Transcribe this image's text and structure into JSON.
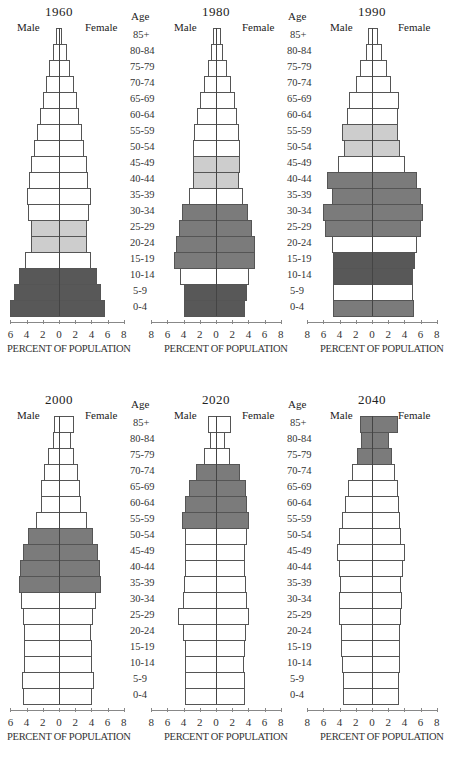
{
  "figure": {
    "side_labels": {
      "male": "Male",
      "female": "Female"
    },
    "age_header": "Age",
    "xlabel": "PERCENT OF POPULATION",
    "ticks": [
      "8",
      "6",
      "4",
      "2",
      "0",
      "2",
      "4",
      "6",
      "8"
    ],
    "colors": {
      "none": "#ffffff",
      "light": "#cdcdcd",
      "mid": "#7b7b7b",
      "dark": "#585858"
    }
  },
  "chart_data": [
    {
      "type": "bar",
      "title": "1960",
      "xlabel": "PERCENT OF POPULATION",
      "categories": [
        "85+",
        "80-84",
        "75-79",
        "70-74",
        "65-69",
        "60-64",
        "55-59",
        "50-54",
        "45-49",
        "40-44",
        "35-39",
        "30-34",
        "25-29",
        "20-24",
        "15-19",
        "10-14",
        "5-9",
        "0-4"
      ],
      "series": [
        {
          "name": "Male",
          "values": [
            0.4,
            0.8,
            1.2,
            1.6,
            2.0,
            2.3,
            2.7,
            3.1,
            3.5,
            3.7,
            4.0,
            3.8,
            3.5,
            3.5,
            4.2,
            5.0,
            5.5,
            6.0
          ]
        },
        {
          "name": "Female",
          "values": [
            0.4,
            1.0,
            1.4,
            1.8,
            2.2,
            2.5,
            2.8,
            3.1,
            3.4,
            3.6,
            3.9,
            3.7,
            3.4,
            3.4,
            4.0,
            4.7,
            5.2,
            5.7
          ]
        }
      ],
      "shading": [
        "none",
        "none",
        "none",
        "none",
        "none",
        "none",
        "none",
        "none",
        "none",
        "none",
        "none",
        "none",
        "light",
        "light",
        "none",
        "dark",
        "dark",
        "dark"
      ],
      "xlim": [
        -8,
        8
      ]
    },
    {
      "type": "bar",
      "title": "1980",
      "xlabel": "PERCENT OF POPULATION",
      "categories": [
        "85+",
        "80-84",
        "75-79",
        "70-74",
        "65-69",
        "60-64",
        "55-59",
        "50-54",
        "45-49",
        "40-44",
        "35-39",
        "30-34",
        "25-29",
        "20-24",
        "15-19",
        "10-14",
        "5-9",
        "0-4"
      ],
      "series": [
        {
          "name": "Male",
          "values": [
            0.4,
            0.6,
            1.0,
            1.5,
            2.0,
            2.3,
            2.7,
            2.9,
            2.9,
            2.8,
            3.3,
            4.2,
            4.6,
            5.0,
            5.2,
            4.5,
            4.0,
            4.0
          ]
        },
        {
          "name": "Female",
          "values": [
            0.6,
            0.9,
            1.4,
            1.9,
            2.3,
            2.6,
            2.9,
            3.0,
            3.0,
            2.9,
            3.3,
            4.0,
            4.4,
            4.8,
            4.8,
            4.1,
            3.8,
            3.6
          ]
        }
      ],
      "shading": [
        "none",
        "none",
        "none",
        "none",
        "none",
        "none",
        "none",
        "none",
        "light",
        "light",
        "none",
        "mid",
        "mid",
        "mid",
        "mid",
        "none",
        "dark",
        "dark"
      ],
      "xlim": [
        -8,
        8
      ]
    },
    {
      "type": "bar",
      "title": "1990",
      "xlabel": "PERCENT OF POPULATION",
      "categories": [
        "85+",
        "80-84",
        "75-79",
        "70-74",
        "65-69",
        "60-64",
        "55-59",
        "50-54",
        "45-49",
        "40-44",
        "35-39",
        "30-34",
        "25-29",
        "20-24",
        "15-19",
        "10-14",
        "5-9",
        "0-4"
      ],
      "series": [
        {
          "name": "Male",
          "values": [
            0.5,
            0.8,
            1.5,
            2.0,
            2.8,
            3.1,
            3.7,
            3.4,
            4.2,
            5.5,
            4.9,
            6.0,
            5.8,
            4.9,
            4.8,
            4.8,
            4.8,
            4.8
          ]
        },
        {
          "name": "Female",
          "values": [
            0.8,
            1.2,
            1.9,
            2.4,
            3.3,
            3.2,
            3.2,
            3.5,
            4.1,
            5.5,
            6.0,
            6.3,
            6.0,
            5.6,
            5.3,
            5.1,
            5.1,
            5.2
          ]
        }
      ],
      "shading": [
        "none",
        "none",
        "none",
        "none",
        "none",
        "none",
        "light",
        "light",
        "none",
        "mid",
        "mid",
        "mid",
        "mid",
        "none",
        "dark",
        "dark",
        "none",
        "mid"
      ],
      "xlim": [
        -8,
        8
      ]
    },
    {
      "type": "bar",
      "title": "2000",
      "xlabel": "PERCENT OF POPULATION",
      "categories": [
        "85+",
        "80-84",
        "75-79",
        "70-74",
        "65-69",
        "60-64",
        "55-59",
        "50-54",
        "45-49",
        "40-44",
        "35-39",
        "30-34",
        "25-29",
        "20-24",
        "15-19",
        "10-14",
        "5-9",
        "0-4"
      ],
      "series": [
        {
          "name": "Male",
          "values": [
            0.6,
            0.8,
            1.3,
            1.8,
            2.2,
            2.2,
            2.8,
            3.8,
            4.4,
            4.8,
            5.0,
            4.7,
            4.4,
            4.3,
            4.3,
            4.3,
            4.6,
            4.4
          ]
        },
        {
          "name": "Female",
          "values": [
            1.8,
            1.5,
            1.9,
            2.3,
            2.6,
            2.7,
            3.4,
            4.2,
            4.8,
            5.1,
            5.2,
            4.6,
            4.2,
            4.0,
            4.1,
            4.1,
            4.3,
            4.1
          ]
        }
      ],
      "shading": [
        "none",
        "none",
        "none",
        "none",
        "none",
        "none",
        "none",
        "mid",
        "mid",
        "mid",
        "mid",
        "none",
        "none",
        "none",
        "none",
        "none",
        "none",
        "none"
      ],
      "xlim": [
        -8,
        8
      ]
    },
    {
      "type": "bar",
      "title": "2020",
      "xlabel": "PERCENT OF POPULATION",
      "categories": [
        "85+",
        "80-84",
        "75-79",
        "70-74",
        "65-69",
        "60-64",
        "55-59",
        "50-54",
        "45-49",
        "40-44",
        "35-39",
        "30-34",
        "25-29",
        "20-24",
        "15-19",
        "10-14",
        "5-9",
        "0-4"
      ],
      "series": [
        {
          "name": "Male",
          "values": [
            1.0,
            0.7,
            1.5,
            2.5,
            3.3,
            3.8,
            4.2,
            3.8,
            3.8,
            3.8,
            4.0,
            4.1,
            4.7,
            4.1,
            3.8,
            3.8,
            3.8,
            3.8
          ]
        },
        {
          "name": "Female",
          "values": [
            1.8,
            1.1,
            1.7,
            3.0,
            3.7,
            3.8,
            4.1,
            3.8,
            3.6,
            3.6,
            3.7,
            3.8,
            4.1,
            3.7,
            3.6,
            3.5,
            3.6,
            3.6
          ]
        }
      ],
      "shading": [
        "none",
        "none",
        "none",
        "mid",
        "mid",
        "mid",
        "mid",
        "none",
        "none",
        "none",
        "none",
        "none",
        "none",
        "none",
        "none",
        "none",
        "none",
        "none"
      ],
      "xlim": [
        -8,
        8
      ]
    },
    {
      "type": "bar",
      "title": "2040",
      "xlabel": "PERCENT OF POPULATION",
      "categories": [
        "85+",
        "80-84",
        "75-79",
        "70-74",
        "65-69",
        "60-64",
        "55-59",
        "50-54",
        "45-49",
        "40-44",
        "35-39",
        "30-34",
        "25-29",
        "20-24",
        "15-19",
        "10-14",
        "5-9",
        "0-4"
      ],
      "series": [
        {
          "name": "Male",
          "values": [
            1.5,
            1.3,
            1.8,
            2.5,
            3.0,
            3.3,
            3.7,
            4.1,
            4.3,
            4.1,
            4.0,
            4.1,
            4.1,
            3.8,
            3.8,
            3.7,
            3.6,
            3.6
          ]
        },
        {
          "name": "Female",
          "values": [
            3.2,
            2.1,
            2.5,
            2.9,
            3.2,
            3.3,
            3.5,
            3.6,
            4.1,
            3.8,
            3.6,
            3.7,
            3.6,
            3.5,
            3.4,
            3.4,
            3.3,
            3.3
          ]
        }
      ],
      "shading": [
        "mid",
        "mid",
        "mid",
        "none",
        "none",
        "none",
        "none",
        "none",
        "none",
        "none",
        "none",
        "none",
        "none",
        "none",
        "none",
        "none",
        "none",
        "none"
      ],
      "xlim": [
        -8,
        8
      ]
    }
  ]
}
